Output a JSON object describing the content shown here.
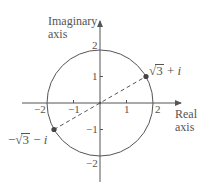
{
  "diagram": {
    "colors": {
      "stroke": "#555555",
      "point": "#444444",
      "text": "#555555",
      "background": "#ffffff"
    },
    "axes": {
      "vertical_label_line1": "Imaginary",
      "vertical_label_line2": "axis",
      "horizontal_label_line1": "Real",
      "horizontal_label_line2": "axis"
    },
    "ticks": {
      "x": [
        {
          "value": -2,
          "label": "−2"
        },
        {
          "value": -1,
          "label": "−1"
        },
        {
          "value": 1,
          "label": "1"
        },
        {
          "value": 2,
          "label": "2"
        }
      ],
      "y": [
        {
          "value": 2,
          "label": "2"
        },
        {
          "value": 1,
          "label": "1"
        },
        {
          "value": -1,
          "label": "−1"
        },
        {
          "value": -2,
          "label": "−2"
        }
      ]
    },
    "circle": {
      "center": [
        0,
        0
      ],
      "radius": 2
    },
    "points": [
      {
        "name": "z1",
        "label_prefix": "",
        "label_radicand": "3",
        "label_suffix": " + ",
        "label_imag": "i",
        "coords": [
          1.732,
          1
        ]
      },
      {
        "name": "z2",
        "label_prefix": "−",
        "label_radicand": "3",
        "label_suffix": " − ",
        "label_imag": "i",
        "coords": [
          -1.732,
          -1
        ]
      }
    ],
    "segment": {
      "from": "z2",
      "to": "z1",
      "style": "dashed"
    }
  }
}
